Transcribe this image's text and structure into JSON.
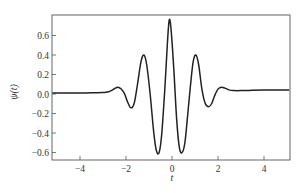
{
  "chart_data": {
    "type": "line",
    "title": "",
    "xlabel": "t",
    "ylabel": "ψ(t)",
    "xlim": [
      -5.2,
      5.1
    ],
    "ylim": [
      -0.68,
      0.8
    ],
    "xticks": [
      -4,
      -2,
      0,
      2,
      4
    ],
    "xtick_labels": [
      "−4",
      "−2",
      "0",
      "2",
      "4"
    ],
    "yticks": [
      -0.6,
      -0.4,
      -0.2,
      0.0,
      0.2,
      0.4,
      0.6
    ],
    "ytick_labels": [
      "−0.6",
      "−0.4",
      "−0.2",
      "0.0",
      "0.2",
      "0.4",
      "0.6"
    ],
    "grid": false,
    "legend": null,
    "series": [
      {
        "name": "ψ(t)",
        "x": [
          -5.2,
          -4.5,
          -4.0,
          -3.5,
          -3.0,
          -2.8,
          -2.6,
          -2.35,
          -2.1,
          -1.95,
          -1.8,
          -1.65,
          -1.5,
          -1.35,
          -1.22,
          -1.1,
          -0.95,
          -0.8,
          -0.68,
          -0.56,
          -0.45,
          -0.32,
          -0.2,
          -0.12,
          -0.04,
          0.08,
          0.2,
          0.32,
          0.44,
          0.56,
          0.68,
          0.8,
          0.92,
          1.04,
          1.16,
          1.3,
          1.45,
          1.6,
          1.72,
          1.85,
          2.0,
          2.15,
          2.3,
          2.5,
          2.7,
          3.0,
          3.5,
          4.0,
          4.5,
          5.1
        ],
        "y": [
          0.01,
          0.01,
          0.01,
          0.012,
          0.015,
          0.02,
          0.04,
          0.07,
          0.02,
          -0.07,
          -0.14,
          -0.1,
          0.1,
          0.33,
          0.4,
          0.3,
          0.0,
          -0.38,
          -0.58,
          -0.6,
          -0.42,
          0.02,
          0.52,
          0.76,
          0.66,
          0.25,
          -0.25,
          -0.55,
          -0.6,
          -0.5,
          -0.22,
          0.08,
          0.33,
          0.4,
          0.3,
          0.05,
          -0.1,
          -0.13,
          -0.1,
          -0.02,
          0.05,
          0.07,
          0.06,
          0.04,
          0.035,
          0.035,
          0.038,
          0.04,
          0.04,
          0.04
        ]
      }
    ]
  }
}
